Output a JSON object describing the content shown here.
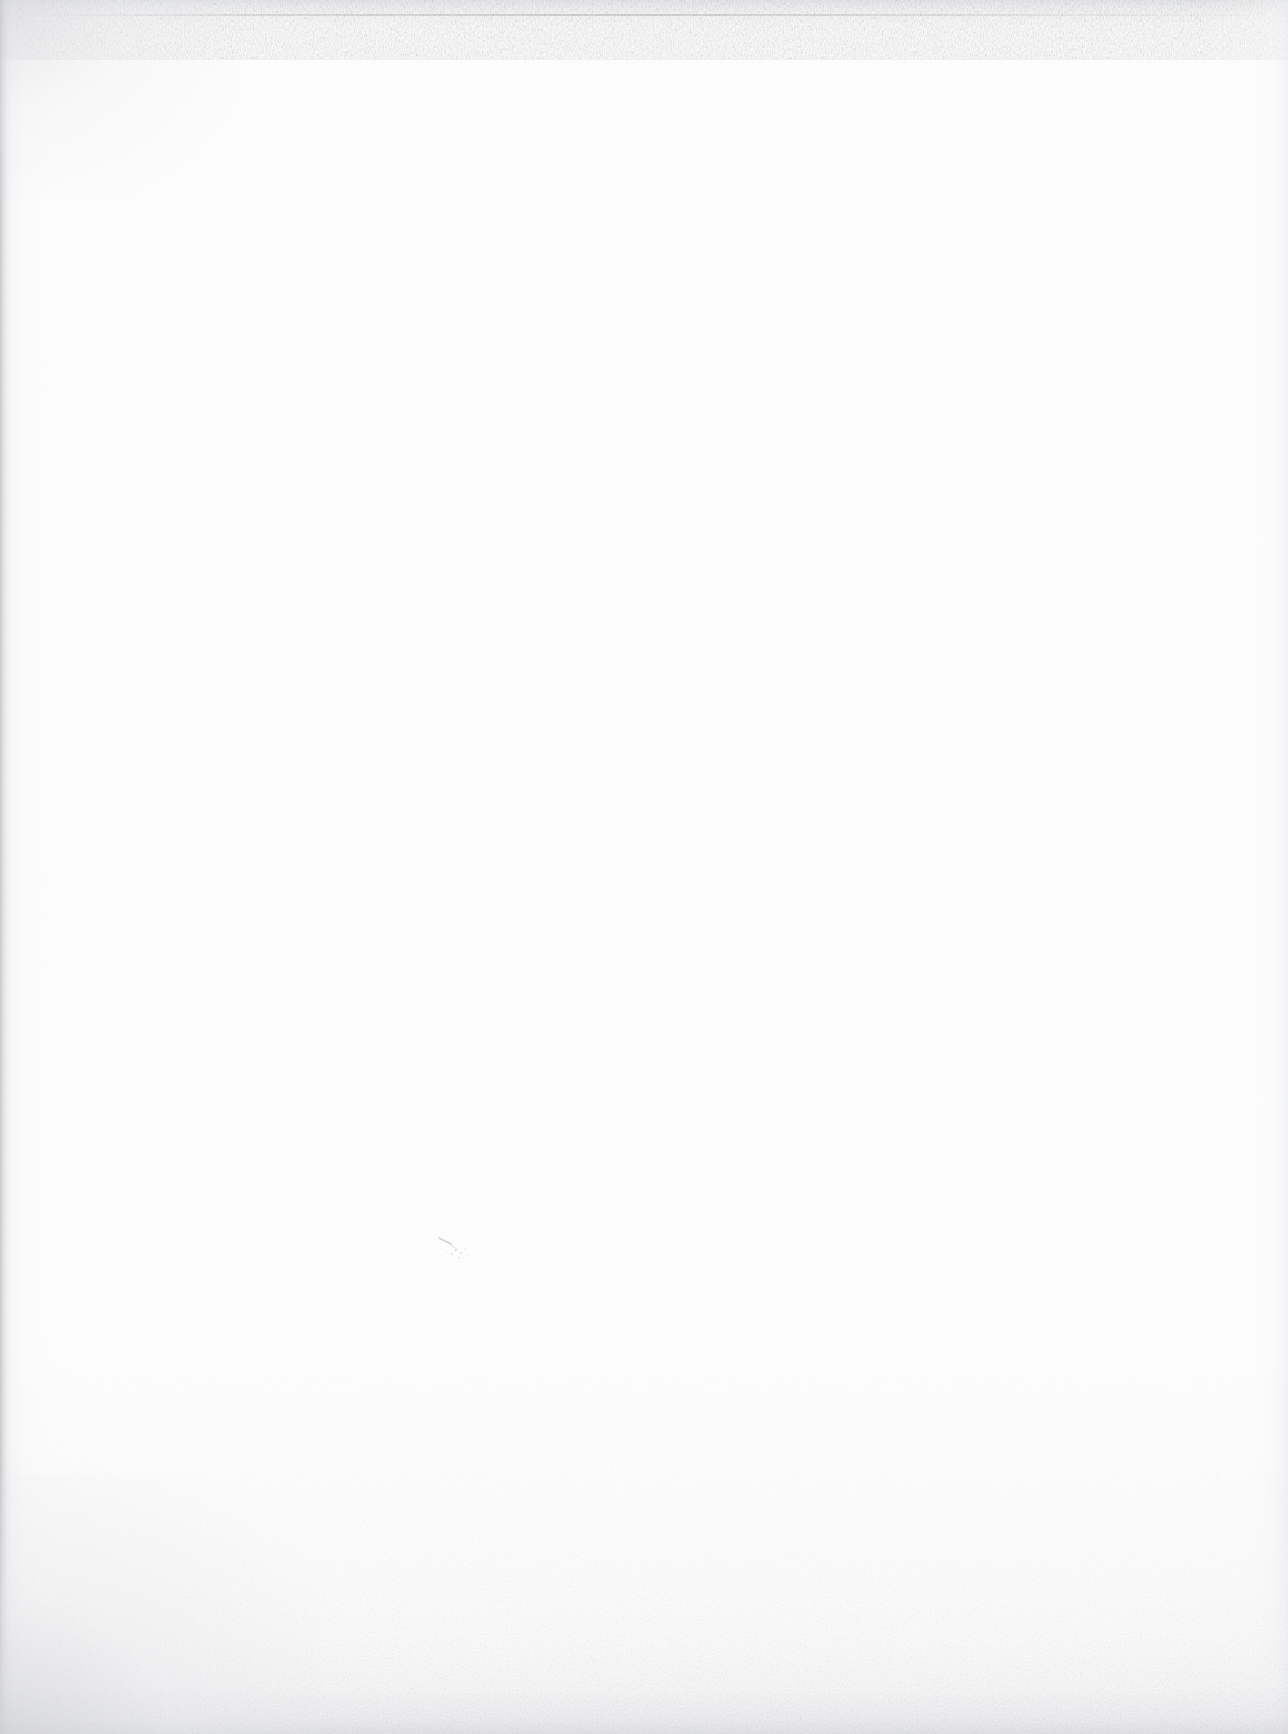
{
  "document": {
    "kind": "scanned-page",
    "page_content_text": "",
    "page_is_blank": true,
    "blank_page_description": "Blank scanned paper page — no printed text, headings, figures or marks",
    "accessible_label": "Blank scanned page"
  },
  "canvas": {
    "width": 1288,
    "height": 1734
  },
  "colors": {
    "paper_white": "#fefefe",
    "paper_base": "#ffffff",
    "edge_shadow_left": "#c6c7ca",
    "edge_shadow_right": "#ecedef",
    "edge_shadow_top": "#e2e3e6",
    "edge_shadow_bottom": "#dbdcdf",
    "grain_speck": "#e9eaec",
    "dust_smudge": "#b9babd"
  },
  "artifacts": {
    "left_edge_shadow": "dark vertical scanner binding shadow along the left border",
    "right_edge_shadow": "faint vertical line near the right border",
    "top_edge_border": "ragged noisy scan border across the top with a darker hairline",
    "bottom_edge_noise": "speckled darker band across the bottom, densest at the bottom-left corner",
    "dust_smudge": "small faint dust smudge near the lower-middle of the page",
    "paper_grain": "fine low-contrast paper grain across the whole sheet"
  },
  "smudge": {
    "x": 432,
    "y": 1232,
    "width": 52,
    "height": 34
  }
}
